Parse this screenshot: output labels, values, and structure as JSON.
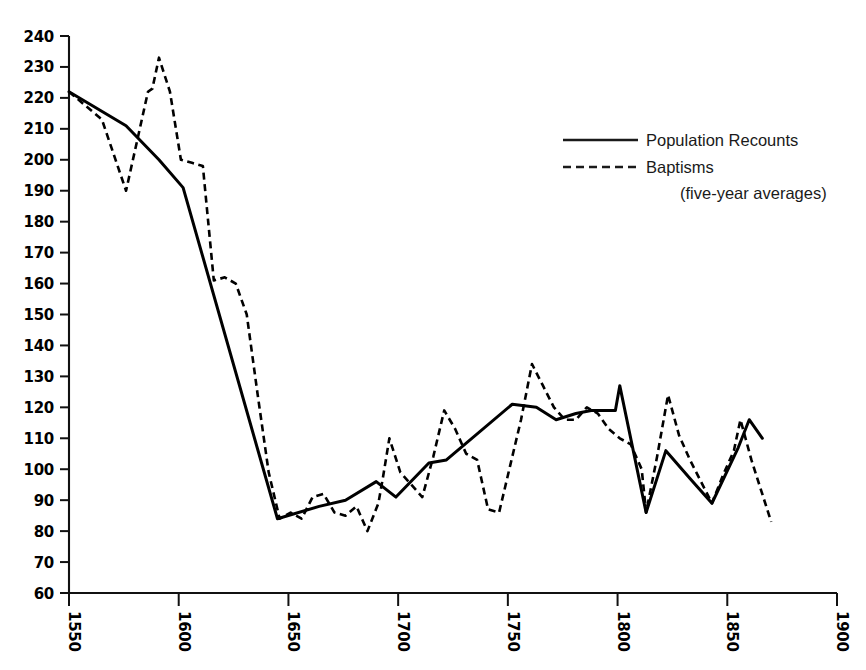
{
  "chart_data": {
    "type": "line",
    "title": "",
    "subtitle": "",
    "xlabel": "",
    "ylabel": "",
    "xlim": [
      1550,
      1900
    ],
    "ylim": [
      60,
      240
    ],
    "grid": false,
    "legend_position": "upper-right",
    "x_ticks": [
      "1550",
      "1600",
      "1650",
      "1700",
      "1750",
      "1800",
      "1850",
      "1900"
    ],
    "y_ticks": [
      "240",
      "230",
      "220",
      "210",
      "200",
      "190",
      "180",
      "170",
      "160",
      "150",
      "140",
      "130",
      "120",
      "110",
      "100",
      "90",
      "80",
      "70",
      "60"
    ],
    "annotations": [
      "(five-year averages)"
    ],
    "series": [
      {
        "name": "Population Recounts",
        "style": "solid",
        "points": [
          [
            1550,
            222
          ],
          [
            1576,
            211
          ],
          [
            1591,
            200
          ],
          [
            1602,
            191
          ],
          [
            1645,
            84
          ],
          [
            1664,
            88
          ],
          [
            1676,
            90
          ],
          [
            1690,
            96
          ],
          [
            1699,
            91
          ],
          [
            1714,
            102
          ],
          [
            1722,
            103
          ],
          [
            1752,
            121
          ],
          [
            1763,
            120
          ],
          [
            1772,
            116
          ],
          [
            1781,
            118
          ],
          [
            1788,
            119
          ],
          [
            1799,
            119
          ],
          [
            1801,
            127
          ],
          [
            1813,
            86
          ],
          [
            1822,
            106
          ],
          [
            1833,
            97
          ],
          [
            1843,
            89
          ],
          [
            1855,
            107
          ],
          [
            1860,
            116
          ],
          [
            1866,
            110
          ]
        ]
      },
      {
        "name": "Baptisms",
        "style": "dashed",
        "points": [
          [
            1550,
            222
          ],
          [
            1565,
            213
          ],
          [
            1576,
            190
          ],
          [
            1586,
            222
          ],
          [
            1588,
            223
          ],
          [
            1591,
            233
          ],
          [
            1596,
            222
          ],
          [
            1601,
            200
          ],
          [
            1606,
            199
          ],
          [
            1611,
            198
          ],
          [
            1616,
            161
          ],
          [
            1621,
            162
          ],
          [
            1626,
            160
          ],
          [
            1631,
            150
          ],
          [
            1636,
            124
          ],
          [
            1641,
            99
          ],
          [
            1646,
            84
          ],
          [
            1651,
            86
          ],
          [
            1656,
            84
          ],
          [
            1661,
            91
          ],
          [
            1666,
            92
          ],
          [
            1671,
            86
          ],
          [
            1676,
            85
          ],
          [
            1681,
            88
          ],
          [
            1686,
            80
          ],
          [
            1691,
            89
          ],
          [
            1693,
            97
          ],
          [
            1696,
            110
          ],
          [
            1701,
            99
          ],
          [
            1706,
            95
          ],
          [
            1711,
            91
          ],
          [
            1716,
            104
          ],
          [
            1721,
            119
          ],
          [
            1726,
            113
          ],
          [
            1731,
            105
          ],
          [
            1736,
            103
          ],
          [
            1741,
            87
          ],
          [
            1746,
            86
          ],
          [
            1751,
            101
          ],
          [
            1756,
            116
          ],
          [
            1761,
            134
          ],
          [
            1766,
            127
          ],
          [
            1771,
            120
          ],
          [
            1776,
            116
          ],
          [
            1781,
            116
          ],
          [
            1786,
            120
          ],
          [
            1791,
            118
          ],
          [
            1796,
            113
          ],
          [
            1801,
            110
          ],
          [
            1806,
            108
          ],
          [
            1811,
            100
          ],
          [
            1813,
            86
          ],
          [
            1818,
            104
          ],
          [
            1823,
            124
          ],
          [
            1828,
            111
          ],
          [
            1833,
            103
          ],
          [
            1838,
            96
          ],
          [
            1843,
            89
          ],
          [
            1848,
            98
          ],
          [
            1853,
            106
          ],
          [
            1856,
            116
          ],
          [
            1861,
            103
          ],
          [
            1870,
            83
          ]
        ]
      }
    ]
  },
  "legend": {
    "items": [
      {
        "label": "Population Recounts",
        "style": "solid"
      },
      {
        "label": "Baptisms",
        "style": "dashed"
      }
    ],
    "note": "(five-year averages)"
  },
  "axes": {
    "y": {
      "labels": [
        "240",
        "230",
        "220",
        "210",
        "200",
        "190",
        "180",
        "170",
        "160",
        "150",
        "140",
        "130",
        "120",
        "110",
        "100",
        "90",
        "80",
        "70",
        "60"
      ],
      "min": 60,
      "max": 240,
      "step": 10
    },
    "x": {
      "labels": [
        "1550",
        "1600",
        "1650",
        "1700",
        "1750",
        "1800",
        "1850",
        "1900"
      ],
      "min": 1550,
      "max": 1900,
      "step": 50
    }
  },
  "colors": {
    "line": "#000000",
    "axis": "#111111",
    "background": "#ffffff",
    "text": "#000000"
  }
}
